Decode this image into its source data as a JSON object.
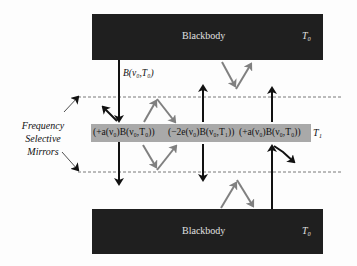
{
  "diagram": {
    "type": "radiative-transfer-schematic",
    "top_body": {
      "label": "Blackbody",
      "temperature": "T₀"
    },
    "bottom_body": {
      "label": "Blackbody",
      "temperature": "T₀"
    },
    "incident_flux_label": "B(ν₀,T₀)",
    "middle_layer": {
      "terms": [
        "(+a(ν₀)B(ν₀,T₀))",
        "(−2e(ν₀)B(ν₀,T₁))",
        "(+a(ν₀)B(ν₀,T₀))"
      ],
      "temperature": "T₁"
    },
    "mirror_label": [
      "Frequency",
      "Selective",
      "Mirrors"
    ],
    "colors": {
      "blackbody": "#1f1f1f",
      "layer": "#a9a9a9",
      "arrow_primary": "#111111",
      "arrow_reflected": "#808080",
      "mirror_line": "#555555"
    }
  }
}
